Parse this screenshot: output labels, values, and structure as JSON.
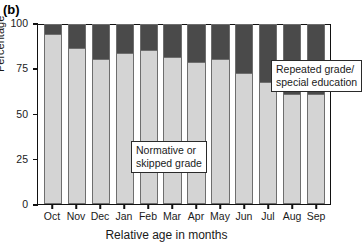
{
  "panel": {
    "label": "(b)"
  },
  "chart_data": {
    "type": "bar",
    "subtype": "stacked-percentage",
    "title": "",
    "xlabel": "Relative age in months",
    "ylabel": "Percentage",
    "ylim": [
      0,
      100
    ],
    "yticks": [
      0,
      25,
      50,
      75,
      100
    ],
    "ytick_labels": [
      "0",
      "25",
      "50",
      "75",
      "100"
    ],
    "grid": false,
    "legend_position": "in-plot annotations",
    "categories": [
      "Oct",
      "Nov",
      "Dec",
      "Jan",
      "Feb",
      "Mar",
      "Apr",
      "May",
      "Jun",
      "Jul",
      "Aug",
      "Sep"
    ],
    "series": [
      {
        "name": "Normative or skipped grade",
        "color": "#d4d4d4",
        "values": [
          95,
          87,
          81,
          84,
          86,
          82,
          79,
          81,
          73,
          68,
          61,
          61
        ]
      },
      {
        "name": "Repeated grade/special education",
        "color": "#4a4a4a",
        "values": [
          5,
          13,
          19,
          16,
          14,
          18,
          21,
          19,
          27,
          32,
          39,
          39
        ]
      }
    ],
    "annotations": [
      {
        "id": "lower",
        "line1": "Normative or",
        "line2": "skipped grade"
      },
      {
        "id": "upper",
        "line1": "Repeated grade/",
        "line2": "special education"
      }
    ]
  }
}
